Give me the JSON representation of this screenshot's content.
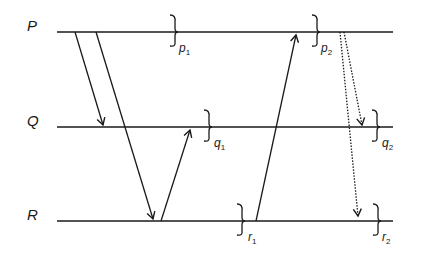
{
  "diagram": {
    "type": "space-time-diagram",
    "processes": [
      {
        "id": "P",
        "label": "P",
        "y": 32
      },
      {
        "id": "Q",
        "label": "Q",
        "y": 127
      },
      {
        "id": "R",
        "label": "R",
        "y": 221
      }
    ],
    "cuts": [
      {
        "id": "p1",
        "label": "p",
        "sub": "1",
        "process": "P"
      },
      {
        "id": "p2",
        "label": "p",
        "sub": "2",
        "process": "P"
      },
      {
        "id": "q1",
        "label": "q",
        "sub": "1",
        "process": "Q"
      },
      {
        "id": "q2",
        "label": "q",
        "sub": "2",
        "process": "Q"
      },
      {
        "id": "r1",
        "label": "r",
        "sub": "1",
        "process": "R"
      },
      {
        "id": "r2",
        "label": "r",
        "sub": "2",
        "process": "R"
      }
    ],
    "messages": [
      {
        "from": "P",
        "to": "Q",
        "style": "solid"
      },
      {
        "from": "P",
        "to": "R",
        "style": "solid"
      },
      {
        "from": "R",
        "to": "Q",
        "style": "solid"
      },
      {
        "from": "R",
        "to": "P",
        "style": "solid"
      },
      {
        "from": "P",
        "to": "Q",
        "style": "dotted"
      },
      {
        "from": "P",
        "to": "R",
        "style": "dotted"
      }
    ],
    "colors": {
      "line": "#1a1a1a",
      "background": "#ffffff"
    }
  }
}
